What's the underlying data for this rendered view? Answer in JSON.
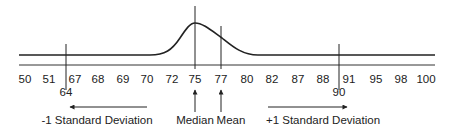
{
  "diagram": {
    "type": "distribution-curve",
    "curve": "right-skewed bell curve",
    "axis_ticks": [
      "50",
      "51",
      "67",
      "68",
      "69",
      "70",
      "72",
      "75",
      "77",
      "80",
      "82",
      "87",
      "88",
      "91",
      "95",
      "98",
      "100"
    ],
    "markers": {
      "minus_one_sd": {
        "value": "64"
      },
      "plus_one_sd": {
        "value": "90"
      },
      "median": {
        "value": "75"
      },
      "mean": {
        "value": "77"
      }
    },
    "labels": {
      "minus_one_sd": "-1 Standard Deviation",
      "median": "Median",
      "mean": "Mean",
      "plus_one_sd": "+1 Standard Deviation"
    },
    "colors": {
      "line": "#222222",
      "background": "#ffffff"
    }
  }
}
